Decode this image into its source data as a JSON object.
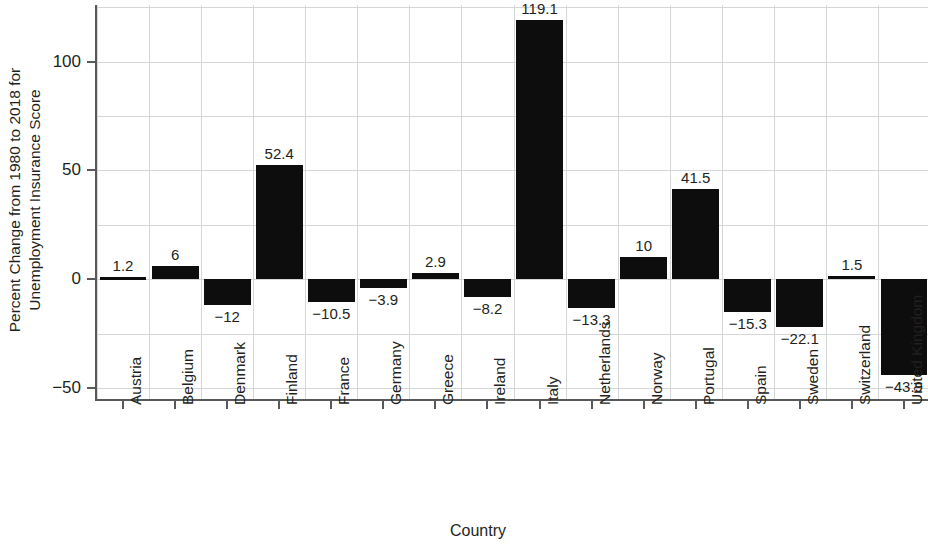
{
  "chart_data": {
    "type": "bar",
    "title": "",
    "xlabel": "Country",
    "ylabel_line1": "Percent Change from 1980 to 2018 for",
    "ylabel_line2": "Unemployment Insurance Score",
    "categories": [
      "Austria",
      "Belgium",
      "Denmark",
      "Finland",
      "France",
      "Germany",
      "Greece",
      "Ireland",
      "Italy",
      "Netherlands",
      "Norway",
      "Portugal",
      "Spain",
      "Sweden",
      "Switzerland",
      "United Kingdom"
    ],
    "values": [
      1.2,
      6,
      -12,
      52.4,
      -10.5,
      -3.9,
      2.9,
      -8.2,
      119.1,
      -13.3,
      10,
      41.5,
      -15.3,
      -22.1,
      1.5,
      -43.9
    ],
    "value_labels": [
      "1.2",
      "6",
      "−12",
      "52.4",
      "−10.5",
      "−3.9",
      "2.9",
      "−8.2",
      "119.1",
      "−13.3",
      "10",
      "41.5",
      "−15.3",
      "−22.1",
      "1.5",
      "−43.9"
    ],
    "ylim": [
      -56,
      126
    ],
    "yticks": [
      100,
      50,
      0,
      -50
    ],
    "ytick_labels": [
      "100",
      "50",
      "0",
      "−50"
    ],
    "yminor_gridlines": [
      125,
      75,
      25,
      -25
    ],
    "grid": true,
    "legend": "none",
    "bar_color": "#0d0d0d",
    "grid_color": "#d5d6d8",
    "axis_color": "#58595b",
    "text_color": "#231f20"
  }
}
